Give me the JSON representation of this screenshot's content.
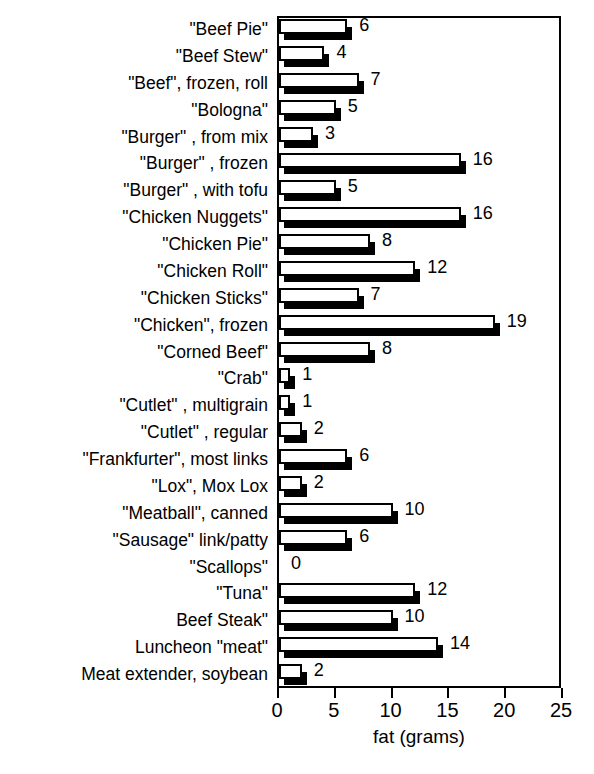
{
  "chart_data": {
    "type": "bar",
    "orientation": "horizontal",
    "title": "VEGETARIAN CHOICES",
    "xlabel": "fat (grams)",
    "ylabel": "",
    "xlim": [
      0,
      25
    ],
    "xticks": [
      0,
      5,
      10,
      15,
      20,
      25
    ],
    "xticklabels": [
      "0",
      "5",
      "10",
      "15",
      "20",
      "25"
    ],
    "grid": false,
    "legend": null,
    "bar_style": "3d-shadow-white-face",
    "categories": [
      "\"Beef Pie\"",
      "\"Beef Stew\"",
      "\"Beef\", frozen, roll",
      "\"Bologna\"",
      "\"Burger\" , from mix",
      "\"Burger\" , frozen",
      "\"Burger\" , with tofu",
      "\"Chicken Nuggets\"",
      "\"Chicken Pie\"",
      "\"Chicken Roll\"",
      "\"Chicken Sticks\"",
      "\"Chicken\", frozen",
      "\"Corned Beef\"",
      "\"Crab\"",
      "\"Cutlet\" , multigrain",
      "\"Cutlet\" , regular",
      "\"Frankfurter\", most links",
      "\"Lox\", Mox Lox",
      "\"Meatball\", canned",
      "\"Sausage\" link/patty",
      "\"Scallops\"",
      "\"Tuna\"",
      "Beef Steak\"",
      "Luncheon \"meat\"",
      "Meat extender, soybean"
    ],
    "values": [
      6,
      4,
      7,
      5,
      3,
      16,
      5,
      16,
      8,
      12,
      7,
      19,
      8,
      1,
      1,
      2,
      6,
      2,
      10,
      6,
      0,
      12,
      10,
      14,
      2
    ],
    "data_labels": [
      "6",
      "4",
      "7",
      "5",
      "3",
      "16",
      "5",
      "16",
      "8",
      "12",
      "7",
      "19",
      "8",
      "1",
      "1",
      "2",
      "6",
      "2",
      "10",
      "6",
      "0",
      "12",
      "10",
      "14",
      "2"
    ],
    "colors": {
      "bar_face": "#ffffff",
      "bar_edge": "#000000",
      "bar_shadow": "#000000",
      "axis": "#000000",
      "background": "#ffffff",
      "text": "#000000"
    }
  }
}
